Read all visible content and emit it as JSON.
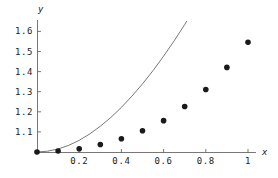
{
  "chart_data": {
    "type": "scatter",
    "title": "",
    "subtitle": "",
    "xlabel": "x",
    "ylabel": "y",
    "xlim": [
      -0.03,
      1.1
    ],
    "ylim": [
      0.99,
      1.66
    ],
    "grid": false,
    "legend": "none",
    "x_ticks": [
      {
        "value": 0.2,
        "label": "0.2"
      },
      {
        "value": 0.4,
        "label": "0.4"
      },
      {
        "value": 0.6,
        "label": "0.6"
      },
      {
        "value": 0.8,
        "label": "0.8"
      },
      {
        "value": 1.0,
        "label": "1"
      }
    ],
    "y_ticks": [
      {
        "value": 1.1,
        "label": "1.1"
      },
      {
        "value": 1.2,
        "label": "1.2"
      },
      {
        "value": 1.3,
        "label": "1.3"
      },
      {
        "value": 1.4,
        "label": "1.4"
      },
      {
        "value": 1.5,
        "label": "1.5"
      },
      {
        "value": 1.6,
        "label": "1.6"
      }
    ],
    "series": [
      {
        "name": "data-points",
        "type": "scatter",
        "marker": "filled-circle",
        "color": "#1a1a1a",
        "marker_size": 4.2,
        "x": [
          0.0,
          0.1,
          0.2,
          0.3,
          0.4,
          0.5,
          0.6,
          0.7,
          0.8,
          0.9,
          1.0
        ],
        "y": [
          1.0,
          1.005,
          1.016,
          1.037,
          1.066,
          1.106,
          1.156,
          1.226,
          1.311,
          1.421,
          1.546
        ]
      },
      {
        "name": "fitted-curve",
        "type": "line",
        "color": "#555555",
        "line_width": 0.8,
        "x": [
          0.0,
          0.05,
          0.1,
          0.15,
          0.2,
          0.25,
          0.3,
          0.35,
          0.4,
          0.45,
          0.5,
          0.55,
          0.6,
          0.65,
          0.7,
          0.75,
          0.8,
          0.85,
          0.9,
          0.95,
          1.0
        ],
        "y": [
          1.0,
          1.004,
          1.015,
          1.033,
          1.058,
          1.09,
          1.128,
          1.172,
          1.222,
          1.278,
          1.339,
          1.405,
          1.477,
          1.553,
          1.634,
          1.72,
          1.81,
          1.905,
          2.004,
          2.107,
          2.214
        ]
      }
    ]
  },
  "axes": {
    "x_axis_name": "x",
    "y_axis_name": "y"
  }
}
